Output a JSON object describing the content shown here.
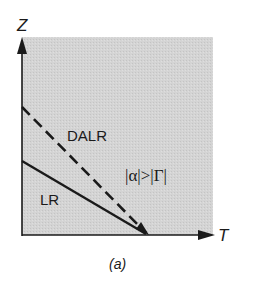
{
  "figure": {
    "caption": "(a)",
    "axes": {
      "x_label": "T",
      "y_label": "Z"
    },
    "lines": [
      {
        "name": "DALR",
        "label": "DALR",
        "style": "dashed"
      },
      {
        "name": "LR",
        "label": "LR",
        "style": "solid"
      }
    ],
    "region_label": "|α|>|Γ|",
    "colors": {
      "background": "#ffffff",
      "shaded_region": "#d2d2d2",
      "ink": "#1a1a1a"
    }
  }
}
